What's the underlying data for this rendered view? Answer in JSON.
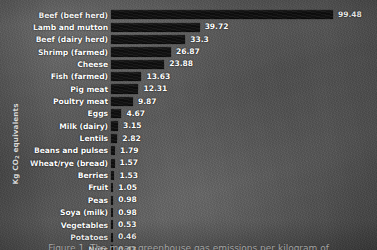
{
  "chart_data": {
    "type": "bar",
    "orientation": "horizontal",
    "title": "",
    "xlabel": "",
    "ylabel": "Kg CO2 equivalents",
    "ylabel_prefix": "Kg CO",
    "ylabel_sub": "2",
    "ylabel_suffix": " equivalents",
    "grid": false,
    "legend": false,
    "xlim": [
      0,
      99.48
    ],
    "categories": [
      "Beef (beef herd)",
      "Lamb and mutton",
      "Beef (dairy herd)",
      "Shrimp (farmed)",
      "Cheese",
      "Fish (farmed)",
      "Pig meat",
      "Poultry meat",
      "Eggs",
      "Milk (dairy)",
      "Lentils",
      "Beans and pulses",
      "Wheat/rye (bread)",
      "Berries",
      "Fruit",
      "Peas",
      "Soya (milk)",
      "Vegetables",
      "Potatoes",
      "Nuts"
    ],
    "values": [
      99.48,
      39.72,
      33.3,
      26.87,
      23.88,
      13.63,
      12.31,
      9.87,
      4.67,
      3.15,
      2.82,
      1.79,
      1.57,
      1.53,
      1.05,
      0.98,
      0.98,
      0.53,
      0.46,
      0.43
    ],
    "value_labels": [
      "99.48",
      "39.72",
      "33.3",
      "26.87",
      "23.88",
      "13.63",
      "12.31",
      "9.87",
      "4.67",
      "3.15",
      "2.82",
      "1.79",
      "1.57",
      "1.53",
      "1.05",
      "0.98",
      "0.98",
      "0.53",
      "0.46",
      "0.43"
    ],
    "bar_color": "#101010",
    "text_color": "#ffffff",
    "background_color": "#585858"
  },
  "caption": {
    "text": "Figure 1. The mean greenhouse gas emissions per kilogram of"
  }
}
